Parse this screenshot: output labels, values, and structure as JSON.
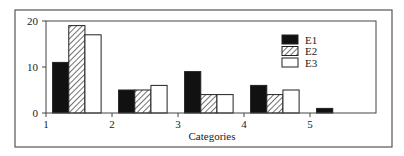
{
  "chart_data": {
    "type": "bar",
    "title": "",
    "xlabel": "Categories",
    "ylabel": "",
    "categories": [
      "1",
      "2",
      "3",
      "4",
      "5"
    ],
    "series": [
      {
        "name": "E1",
        "fill": "solid-black",
        "values": [
          11,
          5,
          9,
          6,
          1
        ]
      },
      {
        "name": "E2",
        "fill": "diagonal-hatch",
        "values": [
          19,
          5,
          4,
          4,
          0
        ]
      },
      {
        "name": "E3",
        "fill": "white",
        "values": [
          17,
          6,
          4,
          5,
          0
        ]
      }
    ],
    "xlim": [
      1,
      6
    ],
    "ylim": [
      0,
      20
    ],
    "x_ticks": [
      "1",
      "2",
      "3",
      "4",
      "5"
    ],
    "y_ticks": [
      "0",
      "10",
      "20"
    ],
    "grid": false,
    "legend_position": "upper-right-inside"
  },
  "colors": {
    "E1": "#111111",
    "E2_hatch": "#333333",
    "E3": "#ffffff",
    "axis": "#444444",
    "frame": "#555555"
  }
}
